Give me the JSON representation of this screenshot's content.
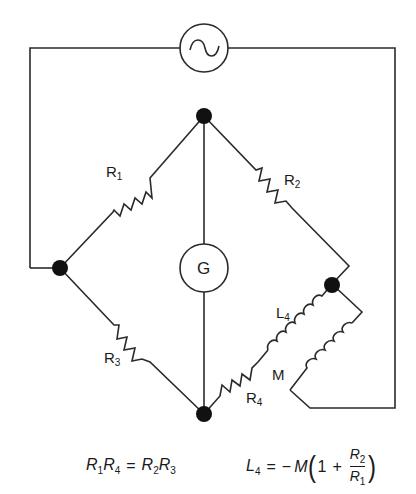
{
  "diagram": {
    "type": "AC bridge circuit (mutual-inductance bridge)",
    "source": {
      "label": "",
      "icon": "ac-source-icon"
    },
    "galvanometer": {
      "label": "G"
    },
    "components": {
      "R1": {
        "base": "R",
        "sub": "1"
      },
      "R2": {
        "base": "R",
        "sub": "2"
      },
      "R3": {
        "base": "R",
        "sub": "3"
      },
      "R4": {
        "base": "R",
        "sub": "4"
      },
      "L4": {
        "base": "L",
        "sub": "4"
      },
      "M": {
        "base": "M",
        "sub": ""
      }
    }
  },
  "equations": {
    "balance_1": {
      "lhs": [
        {
          "base": "R",
          "sub": "1"
        },
        {
          "base": "R",
          "sub": "4"
        }
      ],
      "op": "=",
      "rhs": [
        {
          "base": "R",
          "sub": "2"
        },
        {
          "base": "R",
          "sub": "3"
        }
      ]
    },
    "balance_2": {
      "lhs": {
        "base": "L",
        "sub": "4"
      },
      "op": "=",
      "minus": "−",
      "M": "M",
      "open_paren": "(",
      "one": "1",
      "plus": "+",
      "frac_num": {
        "base": "R",
        "sub": "2"
      },
      "frac_den": {
        "base": "R",
        "sub": "1"
      },
      "close_paren": ")"
    }
  },
  "colors": {
    "wire": "#2a2a2a",
    "node": "#111111",
    "background": "#ffffff"
  }
}
